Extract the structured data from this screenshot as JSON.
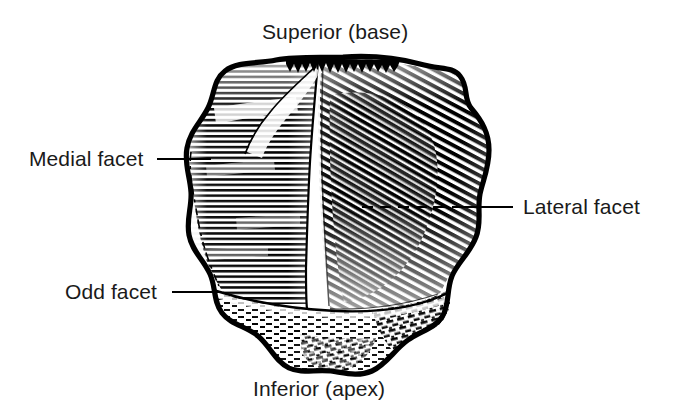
{
  "figure": {
    "view": "posterior-articular-surface",
    "style": "engraving-line-hatching",
    "ink_color": "#000000",
    "background_color": "#ffffff",
    "text_color": "#1a1a1a"
  },
  "labels": {
    "superior": "Superior (base)",
    "inferior": "Inferior (apex)",
    "medial": "Medial facet",
    "odd": "Odd facet",
    "lateral": "Lateral facet"
  },
  "leaders": {
    "medial": {
      "x1": 157,
      "y1": 159,
      "x2": 211,
      "y2": 159
    },
    "odd": {
      "x1": 172,
      "y1": 292,
      "x2": 219,
      "y2": 292
    },
    "lateral": {
      "x1": 513,
      "y1": 207,
      "x2": 463,
      "y2": 207
    }
  },
  "regions": [
    {
      "name": "medial-facet",
      "hatch": "horizontal",
      "density": "medium"
    },
    {
      "name": "lateral-facet",
      "hatch": "diagonal",
      "density": "dense"
    },
    {
      "name": "odd-facet",
      "hatch": "stipple-dash",
      "density": "sparse"
    },
    {
      "name": "apex-ridge",
      "hatch": "irregular-stipple",
      "density": "mixed"
    }
  ]
}
